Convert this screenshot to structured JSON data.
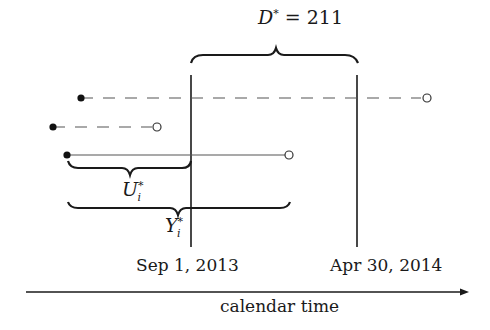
{
  "diagram": {
    "title_annotation": {
      "symbol": "D",
      "superscript": "*",
      "relation": "=",
      "value": "211"
    },
    "markers": [
      {
        "label": "Sep 1, 2013",
        "x": 191
      },
      {
        "label": "Apr 30, 2014",
        "x": 357
      }
    ],
    "axis": {
      "label": "calendar time",
      "direction": "right"
    },
    "intervals": [
      {
        "row": 1,
        "start_x": 81,
        "end_x": 427,
        "y": 98,
        "style": "dashed",
        "start": "filled",
        "end": "open"
      },
      {
        "row": 2,
        "start_x": 53,
        "end_x": 157,
        "y": 127,
        "style": "dashed",
        "start": "filled",
        "end": "open"
      },
      {
        "row": 3,
        "start_x": 67,
        "end_x": 289,
        "y": 155,
        "style": "solid",
        "start": "filled",
        "end": "open"
      }
    ],
    "braces": {
      "u": {
        "symbol": "U",
        "subscript": "i",
        "superscript": "*"
      },
      "y": {
        "symbol": "Y",
        "subscript": "i",
        "superscript": "*"
      },
      "d": {
        "spans": "Sep 1, 2013 to Apr 30, 2014"
      }
    },
    "colors": {
      "line": "#1a1a1a",
      "dashed": "#555555",
      "background": "#ffffff"
    }
  }
}
